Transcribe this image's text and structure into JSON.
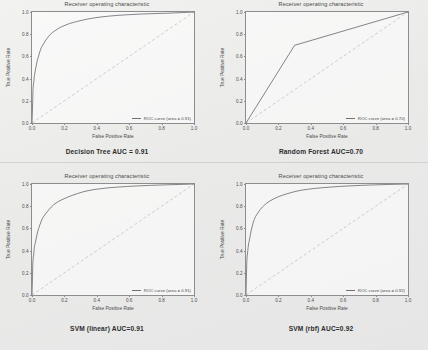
{
  "figure": {
    "background_color": "#ecebea",
    "line_color": "#6f6f74",
    "diagonal_color": "#b9b9bd"
  },
  "common": {
    "title": "Receiver operating characteristic",
    "xlabel": "False Positive Rate",
    "ylabel": "True Positive Rate",
    "xticks": [
      "0.0",
      "0.2",
      "0.4",
      "0.6",
      "0.8",
      "1.0"
    ],
    "yticks": [
      "0.0",
      "0.2",
      "0.4",
      "0.6",
      "0.8",
      "1.0"
    ],
    "xlim": [
      0,
      1
    ],
    "ylim": [
      0,
      1
    ]
  },
  "panels": [
    {
      "id": "decision-tree",
      "title": "Receiver operating characteristic",
      "legend": "ROC curve (area = 0.91)",
      "caption": "Decision Tree AUC = 0.91",
      "auc": 0.91
    },
    {
      "id": "random-forest",
      "title": "Receiver operating characteristic",
      "legend": "ROC curve (area = 0.70)",
      "caption": "Random Forest AUC=0.70",
      "auc": 0.7
    },
    {
      "id": "svm-linear",
      "title": "Receiver operating characteristic",
      "legend": "ROC curve (area = 0.91)",
      "caption": "SVM (linear) AUC=0.91",
      "auc": 0.91
    },
    {
      "id": "svm-rbf",
      "title": "Receiver operating characteristic",
      "legend": "ROC curve (area = 0.92)",
      "caption": "SVM (rbf) AUC=0.92",
      "auc": 0.92
    }
  ],
  "chart_data": [
    {
      "type": "line",
      "id": "decision-tree",
      "title": "Receiver operating characteristic",
      "xlabel": "False Positive Rate",
      "ylabel": "True Positive Rate",
      "xlim": [
        0,
        1
      ],
      "ylim": [
        0,
        1
      ],
      "grid": false,
      "legend_position": "lower right",
      "series": [
        {
          "name": "ROC curve (area = 0.91)",
          "x": [
            0.0,
            0.004,
            0.006,
            0.008,
            0.01,
            0.012,
            0.014,
            0.016,
            0.018,
            0.02,
            0.024,
            0.028,
            0.032,
            0.038,
            0.044,
            0.05,
            0.058,
            0.066,
            0.074,
            0.082,
            0.092,
            0.102,
            0.114,
            0.126,
            0.14,
            0.156,
            0.172,
            0.19,
            0.21,
            0.232,
            0.256,
            0.282,
            0.31,
            0.342,
            0.38,
            0.42,
            0.47,
            0.53,
            0.6,
            0.68,
            0.76,
            0.85,
            0.93,
            1.0
          ],
          "y": [
            0.0,
            0.18,
            0.3,
            0.34,
            0.36,
            0.38,
            0.42,
            0.44,
            0.45,
            0.47,
            0.5,
            0.53,
            0.56,
            0.59,
            0.62,
            0.65,
            0.68,
            0.7,
            0.72,
            0.74,
            0.76,
            0.78,
            0.8,
            0.815,
            0.83,
            0.845,
            0.86,
            0.872,
            0.884,
            0.896,
            0.906,
            0.916,
            0.926,
            0.936,
            0.946,
            0.954,
            0.962,
            0.97,
            0.976,
            0.982,
            0.986,
            0.99,
            0.995,
            1.0
          ]
        },
        {
          "name": "chance",
          "style": "dashed",
          "x": [
            0,
            1
          ],
          "y": [
            0,
            1
          ]
        }
      ]
    },
    {
      "type": "line",
      "id": "random-forest",
      "title": "Receiver operating characteristic",
      "xlabel": "False Positive Rate",
      "ylabel": "True Positive Rate",
      "xlim": [
        0,
        1
      ],
      "ylim": [
        0,
        1
      ],
      "grid": false,
      "legend_position": "lower right",
      "series": [
        {
          "name": "ROC curve (area = 0.70)",
          "x": [
            0.0,
            0.3,
            1.0
          ],
          "y": [
            0.0,
            0.7,
            1.0
          ]
        },
        {
          "name": "chance",
          "style": "dashed",
          "x": [
            0,
            1
          ],
          "y": [
            0,
            1
          ]
        }
      ]
    },
    {
      "type": "line",
      "id": "svm-linear",
      "title": "Receiver operating characteristic",
      "xlabel": "False Positive Rate",
      "ylabel": "True Positive Rate",
      "xlim": [
        0,
        1
      ],
      "ylim": [
        0,
        1
      ],
      "grid": false,
      "legend_position": "lower right",
      "series": [
        {
          "name": "ROC curve (area = 0.91)",
          "x": [
            0.0,
            0.003,
            0.005,
            0.007,
            0.009,
            0.011,
            0.013,
            0.015,
            0.018,
            0.021,
            0.025,
            0.03,
            0.035,
            0.041,
            0.048,
            0.056,
            0.064,
            0.073,
            0.083,
            0.094,
            0.106,
            0.119,
            0.133,
            0.148,
            0.165,
            0.184,
            0.205,
            0.228,
            0.253,
            0.281,
            0.312,
            0.346,
            0.384,
            0.426,
            0.474,
            0.528,
            0.588,
            0.656,
            0.732,
            0.816,
            0.908,
            1.0
          ],
          "y": [
            0.0,
            0.16,
            0.28,
            0.33,
            0.35,
            0.37,
            0.41,
            0.435,
            0.455,
            0.475,
            0.505,
            0.54,
            0.57,
            0.6,
            0.63,
            0.66,
            0.688,
            0.71,
            0.73,
            0.75,
            0.772,
            0.792,
            0.812,
            0.828,
            0.844,
            0.858,
            0.872,
            0.886,
            0.9,
            0.914,
            0.928,
            0.94,
            0.95,
            0.958,
            0.966,
            0.972,
            0.978,
            0.983,
            0.988,
            0.992,
            0.996,
            1.0
          ]
        },
        {
          "name": "chance",
          "style": "dashed",
          "x": [
            0,
            1
          ],
          "y": [
            0,
            1
          ]
        }
      ]
    },
    {
      "type": "line",
      "id": "svm-rbf",
      "title": "Receiver operating characteristic",
      "xlabel": "False Positive Rate",
      "ylabel": "True Positive Rate",
      "xlim": [
        0,
        1
      ],
      "ylim": [
        0,
        1
      ],
      "grid": false,
      "legend_position": "lower right",
      "series": [
        {
          "name": "ROC curve (area = 0.92)",
          "x": [
            0.0,
            0.003,
            0.005,
            0.007,
            0.009,
            0.011,
            0.013,
            0.016,
            0.019,
            0.023,
            0.027,
            0.032,
            0.038,
            0.044,
            0.051,
            0.059,
            0.068,
            0.078,
            0.089,
            0.101,
            0.114,
            0.128,
            0.144,
            0.161,
            0.18,
            0.201,
            0.224,
            0.249,
            0.277,
            0.308,
            0.342,
            0.38,
            0.422,
            0.468,
            0.52,
            0.578,
            0.642,
            0.714,
            0.794,
            0.882,
            1.0
          ],
          "y": [
            0.0,
            0.19,
            0.3,
            0.35,
            0.37,
            0.4,
            0.43,
            0.46,
            0.48,
            0.51,
            0.545,
            0.58,
            0.615,
            0.65,
            0.68,
            0.706,
            0.728,
            0.75,
            0.772,
            0.792,
            0.81,
            0.828,
            0.844,
            0.858,
            0.872,
            0.886,
            0.898,
            0.91,
            0.922,
            0.934,
            0.944,
            0.952,
            0.96,
            0.966,
            0.972,
            0.978,
            0.983,
            0.988,
            0.992,
            0.996,
            1.0
          ]
        },
        {
          "name": "chance",
          "style": "dashed",
          "x": [
            0,
            1
          ],
          "y": [
            0,
            1
          ]
        }
      ]
    }
  ]
}
